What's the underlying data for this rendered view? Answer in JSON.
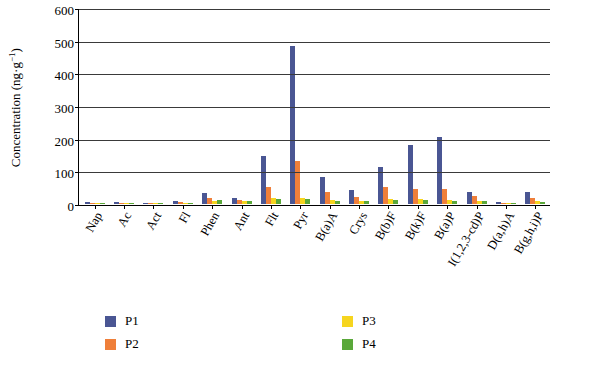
{
  "chart_data": {
    "type": "bar",
    "title": "",
    "xlabel": "",
    "ylabel": "Concentration (ng g−1)",
    "ylabel_main": "Concentration (ng·g",
    "ylabel_sup": "−1",
    "ylabel_tail": ")",
    "ylim": [
      0,
      600
    ],
    "yticks": [
      0,
      100,
      200,
      300,
      400,
      500,
      600
    ],
    "ytick_labels": [
      "0",
      "100",
      "200",
      "300",
      "400",
      "500",
      "600"
    ],
    "grid": true,
    "legend_position": "bottom",
    "categories": [
      "Nap",
      "Ac",
      "Act",
      "Fl",
      "Phen",
      "Ant",
      "Flt",
      "Pyr",
      "B(a)A",
      "Crys",
      "B(b)F",
      "B(k)F",
      "B(a)P",
      "I(1,2,3-cd)P",
      "D(a,h)A",
      "B(g,h,i)P"
    ],
    "series": [
      {
        "name": "P1",
        "color": "#4a5693",
        "values": [
          5,
          6,
          4,
          8,
          33,
          17,
          148,
          487,
          83,
          44,
          113,
          183,
          207,
          36,
          7,
          36
        ]
      },
      {
        "name": "P2",
        "color": "#ef7f3a",
        "values": [
          3,
          3,
          3,
          5,
          20,
          12,
          53,
          133,
          38,
          22,
          53,
          47,
          47,
          24,
          4,
          20
        ]
      },
      {
        "name": "P3",
        "color": "#f6d51f",
        "values": [
          2,
          2,
          2,
          3,
          10,
          8,
          18,
          20,
          12,
          10,
          16,
          14,
          12,
          9,
          3,
          8
        ]
      },
      {
        "name": "P4",
        "color": "#5aa83a",
        "values": [
          2,
          2,
          2,
          3,
          11,
          9,
          14,
          16,
          10,
          9,
          13,
          12,
          10,
          8,
          3,
          7
        ]
      }
    ]
  }
}
